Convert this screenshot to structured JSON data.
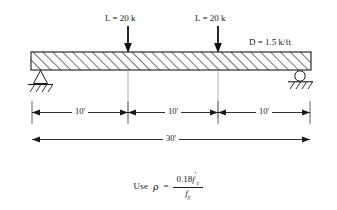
{
  "figure": {
    "type": "structural-beam-loading-diagram",
    "background_color": "#ffffff",
    "line_color": "#1a1a1a",
    "extension_line_color": "#b0b0b0"
  },
  "loads": {
    "point_loads": [
      {
        "label": "L = 20 k",
        "symbol": "L",
        "value": "20",
        "unit": "k",
        "position_ft": 10
      },
      {
        "label": "L = 20 k",
        "symbol": "L",
        "value": "20",
        "unit": "k",
        "position_ft": 20
      }
    ],
    "distributed_load": {
      "label": "D = 1.5 k/ft",
      "symbol": "D",
      "value": "1.5",
      "unit": "k/ft"
    }
  },
  "supports": {
    "left": {
      "type": "pin",
      "name": "pinned-support"
    },
    "right": {
      "type": "roller",
      "name": "roller-support"
    }
  },
  "dimensions": {
    "segments": [
      "10'",
      "10'",
      "10'"
    ],
    "total": "30'"
  },
  "formula": {
    "prefix": "Use",
    "variable": "ρ",
    "equals": "=",
    "numerator_coefficient": "0.18",
    "numerator_symbol": "f",
    "numerator_prime": "′",
    "numerator_subscript": "c",
    "denominator_symbol": "f",
    "denominator_subscript": "y",
    "plain_text": "Use ρ = 0.18 f'c / fy"
  }
}
